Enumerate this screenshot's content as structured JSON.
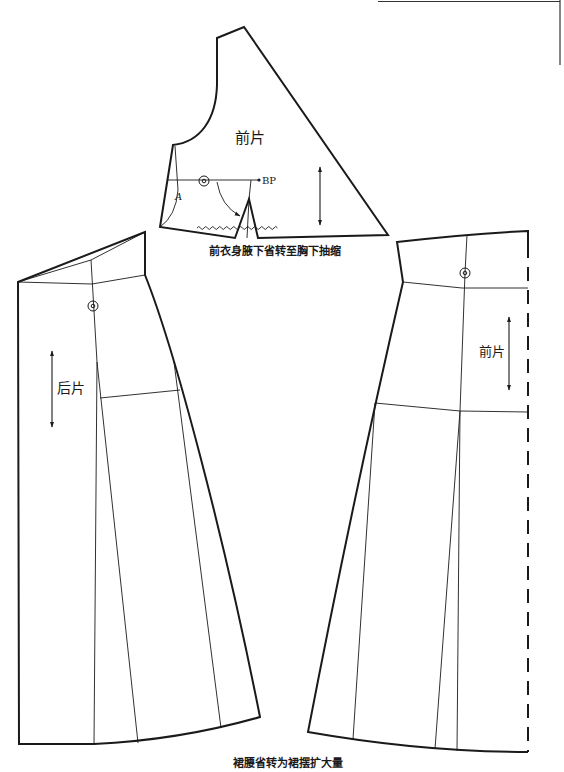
{
  "figure": {
    "front_bodice": {
      "label": "前片",
      "bp_label": "BP",
      "point_label": "A",
      "caption": "前衣身腋下省转至胸下抽缩"
    },
    "back_skirt": {
      "label": "后片"
    },
    "front_skirt": {
      "label": "前片"
    },
    "skirt_caption": "裙腰省转为裙摆扩大量"
  },
  "colors": {
    "line": "#1a1a1a",
    "background": "#ffffff"
  }
}
